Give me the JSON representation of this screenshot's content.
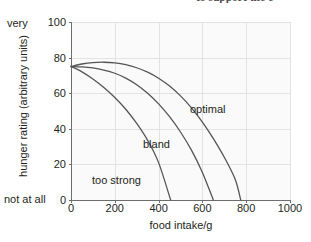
{
  "clipped_header": {
    "text": "to support the e"
  },
  "chart_data": {
    "type": "line",
    "title": "",
    "xlabel": "food intake/g",
    "ylabel": "hunger rating (arbitrary units)",
    "xlim": [
      0,
      1000
    ],
    "ylim": [
      0,
      100
    ],
    "xticks": [
      0,
      200,
      400,
      600,
      800,
      1000
    ],
    "yticks": [
      0,
      20,
      40,
      60,
      80,
      100
    ],
    "xtick_labels": [
      "0",
      "200",
      "400",
      "600",
      "800",
      "1000"
    ],
    "ytick_labels": [
      "0",
      "20",
      "40",
      "60",
      "80",
      "100"
    ],
    "y_axis_end_labels": {
      "top": "very",
      "bottom": "not at all"
    },
    "grid": true,
    "legend_position": "inline-annotations",
    "series": [
      {
        "name": "optimal",
        "label": "optimal",
        "color": "#555555",
        "x": [
          0,
          50,
          100,
          150,
          200,
          250,
          300,
          350,
          400,
          450,
          500,
          550,
          600,
          650,
          700,
          750,
          775
        ],
        "y": [
          75,
          76.4,
          77.2,
          77.4,
          77.0,
          76.0,
          74.3,
          71.8,
          68.4,
          64.0,
          58.5,
          51.8,
          43.8,
          34.5,
          24.0,
          11.5,
          0
        ]
      },
      {
        "name": "bland",
        "label": "bland",
        "color": "#555555",
        "x": [
          0,
          50,
          100,
          150,
          200,
          250,
          300,
          350,
          400,
          450,
          500,
          550,
          600,
          650
        ],
        "y": [
          75,
          74.8,
          74.2,
          73.0,
          71.2,
          68.5,
          64.8,
          60.0,
          54.0,
          46.8,
          38.2,
          28.0,
          15.5,
          0
        ]
      },
      {
        "name": "too strong",
        "label": "too strong",
        "color": "#555555",
        "x": [
          0,
          50,
          100,
          150,
          200,
          250,
          300,
          350,
          400,
          455
        ],
        "y": [
          75,
          72.0,
          68.0,
          63.2,
          57.6,
          51.0,
          43.0,
          33.5,
          21.0,
          0
        ]
      }
    ],
    "colors": {
      "curve": "#555555",
      "grid": "#e3e3e3",
      "axis": "#6d6d6d",
      "plot_background": "#fafafa",
      "text": "#231f20"
    }
  }
}
